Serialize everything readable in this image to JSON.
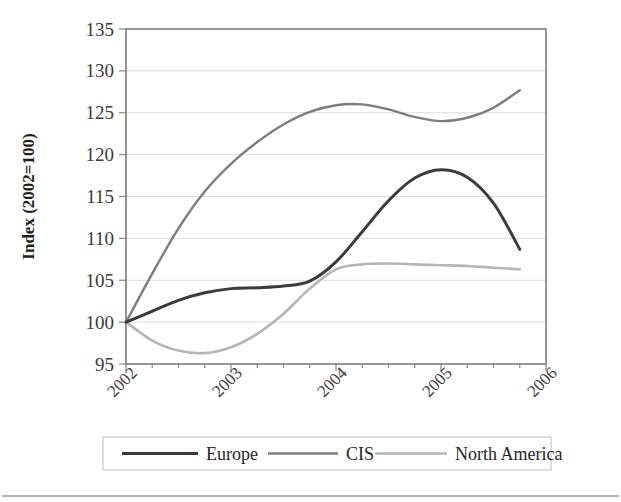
{
  "chart_data": {
    "type": "line",
    "title": "",
    "xlabel": "",
    "ylabel": "Index (2002=100)",
    "ylim": [
      95,
      135
    ],
    "yticks": [
      95,
      100,
      105,
      110,
      115,
      120,
      125,
      130,
      135
    ],
    "xlim": [
      2002,
      2006
    ],
    "xticks": [
      2002,
      2003,
      2004,
      2005,
      2006
    ],
    "xtick_labels": [
      "2002",
      "2003",
      "2004",
      "2005",
      "2006"
    ],
    "xtick_rotation": 45,
    "grid": "horizontal",
    "legend_position": "bottom",
    "x": [
      2002.0,
      2002.25,
      2002.5,
      2002.75,
      2003.0,
      2003.25,
      2003.5,
      2003.75,
      2004.0,
      2004.25,
      2004.5,
      2004.75,
      2005.0,
      2005.25,
      2005.5,
      2005.75
    ],
    "series": [
      {
        "name": "Europe",
        "color": "#3b3b3b",
        "width": 3.0,
        "values": [
          100.0,
          101.3,
          102.6,
          103.5,
          104.0,
          104.1,
          104.3,
          104.9,
          107.2,
          110.8,
          114.5,
          117.2,
          118.2,
          117.3,
          114.2,
          108.7
        ]
      },
      {
        "name": "CIS",
        "color": "#7d7d7d",
        "width": 2.4,
        "values": [
          100.0,
          105.8,
          111.2,
          115.6,
          118.9,
          121.5,
          123.6,
          125.1,
          125.9,
          126.0,
          125.4,
          124.5,
          124.0,
          124.4,
          125.6,
          127.7
        ]
      },
      {
        "name": "North America",
        "color": "#b5b5b5",
        "width": 2.6,
        "values": [
          100.0,
          97.8,
          96.6,
          96.3,
          97.0,
          98.6,
          101.0,
          104.0,
          106.3,
          106.9,
          107.0,
          106.9,
          106.8,
          106.7,
          106.5,
          106.3
        ]
      }
    ]
  },
  "legend": {
    "entries": [
      {
        "label": "Europe"
      },
      {
        "label": "CIS"
      },
      {
        "label": "North America"
      }
    ]
  }
}
